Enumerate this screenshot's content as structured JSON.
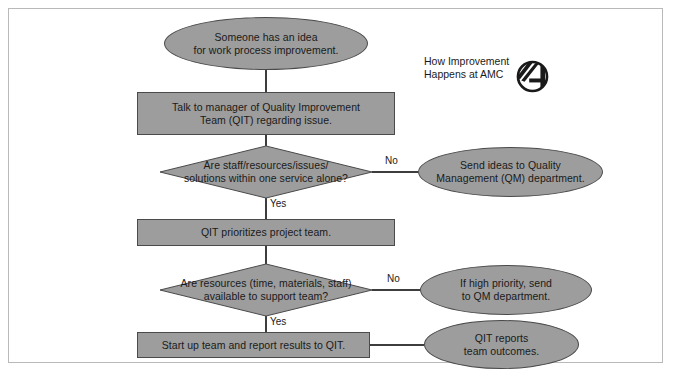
{
  "heading": {
    "line1": "How Improvement",
    "line2": "Happens at AMC",
    "text": "How Improvement\nHappens at AMC"
  },
  "logo": {
    "name": "amc-logo",
    "alt": "AMC logo"
  },
  "colors": {
    "shape_fill": "#9d9d9d",
    "shape_stroke": "#4a4a4a",
    "line": "#3d3d3d",
    "text": "#1a1a1a",
    "frame_border": "#b9b9b9",
    "page_background": "#ffffff"
  },
  "flowchart": {
    "type": "flowchart",
    "nodes": [
      {
        "id": "start",
        "shape": "ellipse",
        "text": "Someone has an idea\nfor work process improvement."
      },
      {
        "id": "talk-to-manager",
        "shape": "rectangle",
        "text": "Talk to manager of Quality Improvement\nTeam (QIT) regarding issue."
      },
      {
        "id": "decision-one-service",
        "shape": "diamond",
        "text": "Are staff/resources/issues/\nsolutions within one service alone?"
      },
      {
        "id": "send-to-qm",
        "shape": "ellipse",
        "text": "Send ideas to Quality\nManagement (QM) department."
      },
      {
        "id": "qit-prioritizes",
        "shape": "rectangle",
        "text": "QIT prioritizes project team."
      },
      {
        "id": "decision-resources",
        "shape": "diamond",
        "text": "Are resources (time, materials, staff)\navailable to support team?"
      },
      {
        "id": "high-priority-qm",
        "shape": "ellipse",
        "text": "If high priority, send\nto QM department."
      },
      {
        "id": "start-up-team",
        "shape": "rectangle",
        "text": "Start up team and report results to QIT."
      },
      {
        "id": "qit-reports",
        "shape": "ellipse",
        "text": "QIT reports\nteam outcomes."
      }
    ],
    "edge_labels": {
      "no_one_service": "No",
      "yes_one_service": "Yes",
      "no_resources": "No",
      "yes_resources": "Yes"
    },
    "edges": [
      {
        "from": "start",
        "to": "talk-to-manager",
        "label": ""
      },
      {
        "from": "talk-to-manager",
        "to": "decision-one-service",
        "label": ""
      },
      {
        "from": "decision-one-service",
        "to": "send-to-qm",
        "label": "No"
      },
      {
        "from": "decision-one-service",
        "to": "qit-prioritizes",
        "label": "Yes"
      },
      {
        "from": "qit-prioritizes",
        "to": "decision-resources",
        "label": ""
      },
      {
        "from": "decision-resources",
        "to": "high-priority-qm",
        "label": "No"
      },
      {
        "from": "decision-resources",
        "to": "start-up-team",
        "label": "Yes"
      },
      {
        "from": "start-up-team",
        "to": "qit-reports",
        "label": ""
      }
    ]
  }
}
